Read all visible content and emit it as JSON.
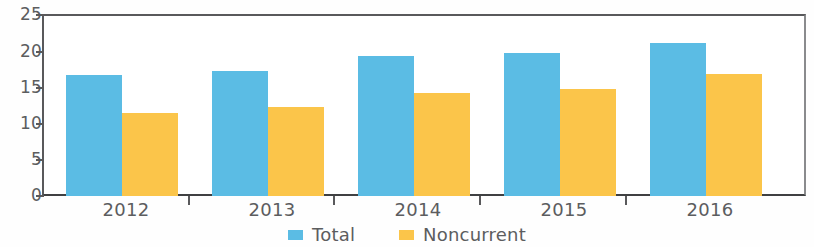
{
  "chart_data": {
    "type": "bar",
    "title": "",
    "subtitle": "",
    "xlabel": "",
    "ylabel": "",
    "categories": [
      "2012",
      "2013",
      "2014",
      "2015",
      "2016"
    ],
    "series": [
      {
        "name": "Total",
        "color": "#5bbce4",
        "values": [
          16.8,
          17.3,
          19.4,
          19.9,
          21.2
        ]
      },
      {
        "name": "Noncurrent",
        "color": "#fbc54a",
        "values": [
          11.5,
          12.3,
          14.3,
          14.8,
          17.0
        ]
      }
    ],
    "ylim": [
      0,
      25
    ],
    "yticks": [
      0,
      5,
      10,
      15,
      20,
      25
    ],
    "ytick_labels": [
      "0",
      "5",
      "10",
      "15",
      "20",
      "25"
    ],
    "grid": false,
    "legend_position": "bottom",
    "legend": [
      "Total",
      "Noncurrent"
    ]
  },
  "axis": {
    "y_labels": [
      "25",
      "20",
      "15",
      "10",
      "5",
      "0"
    ],
    "x_labels": [
      "2012",
      "2013",
      "2014",
      "2015",
      "2016"
    ]
  },
  "legend": {
    "items": [
      {
        "label": "Total",
        "color": "#5bbce4"
      },
      {
        "label": "Noncurrent",
        "color": "#fbc54a"
      }
    ]
  },
  "colors": {
    "total": "#5bbce4",
    "noncurrent": "#fbc54a",
    "axis": "#59595b",
    "text": "#5c5d5f",
    "background": "#ffffff"
  }
}
